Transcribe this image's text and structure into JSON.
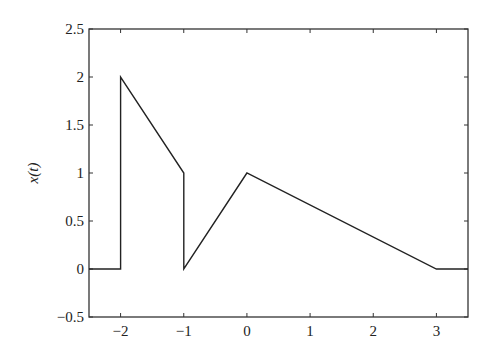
{
  "chart_data": {
    "type": "line",
    "title": "",
    "xlabel": "",
    "ylabel": "x(t)",
    "xlim": [
      -2.5,
      3.5
    ],
    "ylim": [
      -0.5,
      2.5
    ],
    "grid": false,
    "legend": null,
    "x_ticks": [
      -2,
      -1,
      0,
      1,
      2,
      3
    ],
    "x_tick_labels": [
      "−2",
      "−1",
      "0",
      "1",
      "2",
      "3"
    ],
    "y_ticks": [
      -0.5,
      0,
      0.5,
      1,
      1.5,
      2,
      2.5
    ],
    "y_tick_labels": [
      "−0.5",
      "0",
      "0.5",
      "1",
      "1.5",
      "2",
      "2.5"
    ],
    "series": [
      {
        "name": "x(t)",
        "color": "#222222",
        "x": [
          -2.5,
          -2,
          -2,
          -1,
          -1,
          0,
          3,
          3.5
        ],
        "y": [
          0,
          0,
          2,
          1,
          0,
          1,
          0,
          0
        ]
      }
    ]
  }
}
